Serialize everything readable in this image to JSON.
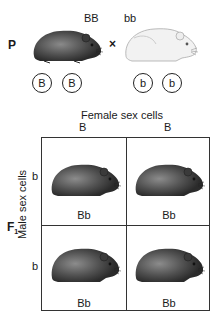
{
  "parents": {
    "generation_label": "P",
    "cross_symbol": "×",
    "left": {
      "genotype": "BB",
      "color": "dark",
      "alleles": [
        "B",
        "B"
      ]
    },
    "right": {
      "genotype": "bb",
      "color": "white",
      "alleles": [
        "b",
        "b"
      ]
    }
  },
  "punnett": {
    "column_header": "Female sex cells",
    "column_alleles": [
      "B",
      "B"
    ],
    "row_header": "Male sex cells",
    "row_alleles": [
      "b",
      "b"
    ],
    "generation_label": "F",
    "generation_subscript": "1",
    "cells": [
      {
        "genotype": "Bb",
        "color": "dark"
      },
      {
        "genotype": "Bb",
        "color": "dark"
      },
      {
        "genotype": "Bb",
        "color": "dark"
      },
      {
        "genotype": "Bb",
        "color": "dark"
      }
    ]
  },
  "colors": {
    "dark_fur": "#4a4a4a",
    "white_fur": "#e8e8e8",
    "line": "#333333"
  }
}
